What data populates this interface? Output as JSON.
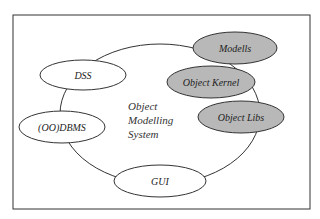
{
  "diagram": {
    "center_lines": [
      "Object",
      "Modelling",
      "System"
    ],
    "nodes": [
      {
        "id": "dss",
        "label": "DSS",
        "fill": "#ffffff"
      },
      {
        "id": "oodbms",
        "label": "(OO)DBMS",
        "fill": "#ffffff"
      },
      {
        "id": "gui",
        "label": "GUI",
        "fill": "#ffffff"
      },
      {
        "id": "modells",
        "label": "Modells",
        "fill": "#b8b8b8"
      },
      {
        "id": "object-kernel",
        "label": "Object Kernel",
        "fill": "#b8b8b8"
      },
      {
        "id": "object-libs",
        "label": "Object Libs",
        "fill": "#b8b8b8"
      }
    ]
  }
}
